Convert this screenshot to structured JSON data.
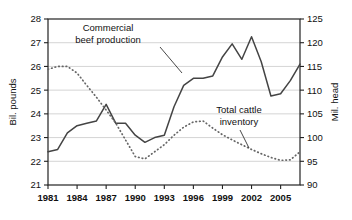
{
  "chart_data": {
    "type": "line",
    "title": "",
    "xlabel": "",
    "ylabel": "Bil. pounds",
    "y2label": "Mil. head",
    "xlim": [
      1981,
      2007
    ],
    "ylim": [
      21,
      28
    ],
    "y2lim": [
      90,
      125
    ],
    "ytick_step": 1,
    "y2tick_step": 5,
    "grid": true,
    "legend_position": "inline-annotation",
    "xticks": [
      1981,
      1984,
      1987,
      1990,
      1993,
      1996,
      1999,
      2002,
      2005
    ],
    "xtick_labels": [
      "1981",
      "1984",
      "1987",
      "1990",
      "1993",
      "1996",
      "1999",
      "2002",
      "2005"
    ],
    "yticks": [
      21,
      22,
      23,
      24,
      25,
      26,
      27,
      28
    ],
    "ytick_labels": [
      "21",
      "22",
      "23",
      "24",
      "25",
      "26",
      "27",
      "28"
    ],
    "y2ticks": [
      90,
      95,
      100,
      105,
      110,
      115,
      120,
      125
    ],
    "y2tick_labels": [
      "90",
      "95",
      "100",
      "105",
      "110",
      "115",
      "120",
      "125"
    ],
    "x": [
      1981,
      1982,
      1983,
      1984,
      1985,
      1986,
      1987,
      1988,
      1989,
      1990,
      1991,
      1992,
      1993,
      1994,
      1995,
      1996,
      1997,
      1998,
      1999,
      2000,
      2001,
      2002,
      2003,
      2004,
      2005,
      2006,
      2007
    ],
    "series": [
      {
        "name": "Commercial beef production",
        "axis": "left",
        "style": "solid",
        "color": "#444444",
        "units": "Bil. pounds",
        "values": [
          22.4,
          22.5,
          23.2,
          23.5,
          23.6,
          23.7,
          24.4,
          23.6,
          23.6,
          23.1,
          22.8,
          23.0,
          23.1,
          24.3,
          25.2,
          25.5,
          25.5,
          25.6,
          26.4,
          26.95,
          26.3,
          27.25,
          26.2,
          24.75,
          24.85,
          25.4,
          26.1
        ]
      },
      {
        "name": "Total cattle inventory",
        "axis": "right",
        "style": "dotted",
        "color": "#666666",
        "units": "Mil. head",
        "values": [
          114.4,
          115.0,
          115.0,
          113.6,
          111.0,
          108.5,
          105.8,
          103.0,
          99.5,
          96.0,
          95.5,
          97.0,
          98.5,
          100.5,
          102.2,
          103.3,
          103.5,
          102.0,
          100.6,
          99.5,
          98.5,
          97.5,
          96.6,
          95.8,
          95.2,
          95.3,
          97.0
        ]
      }
    ],
    "annotations": [
      {
        "name": "commercial-beef-production",
        "text_lines": [
          "Commercial",
          "beef production"
        ],
        "text_x": 108,
        "text_y": 31,
        "align": "middle",
        "leader": [
          [
            160,
            47
          ],
          [
            182,
            73
          ]
        ]
      },
      {
        "name": "total-cattle-inventory",
        "text_lines": [
          "Total cattle",
          "inventory"
        ],
        "text_x": 239,
        "text_y": 113,
        "align": "middle",
        "leader": [
          [
            240,
            130
          ],
          [
            249,
            148
          ]
        ]
      }
    ]
  }
}
